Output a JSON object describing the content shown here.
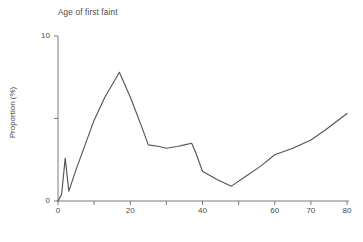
{
  "chart_data": {
    "type": "line",
    "title": "Age of first faint",
    "xlabel": "",
    "ylabel": "Proportion (%)",
    "xlim": [
      0,
      80
    ],
    "ylim": [
      0,
      10
    ],
    "grid": false,
    "legend": null,
    "x_ticks": [
      {
        "value": 0,
        "label": "0"
      },
      {
        "value": 10,
        "label": ""
      },
      {
        "value": 20,
        "label": "20"
      },
      {
        "value": 30,
        "label": ""
      },
      {
        "value": 40,
        "label": "40"
      },
      {
        "value": 50,
        "label": ""
      },
      {
        "value": 60,
        "label": "60"
      },
      {
        "value": 70,
        "label": "70"
      },
      {
        "value": 80,
        "label": "80"
      }
    ],
    "y_ticks": [
      {
        "value": 0,
        "label": "0"
      },
      {
        "value": 5,
        "label": ""
      },
      {
        "value": 10,
        "label": "10"
      }
    ],
    "line_color": "#555555",
    "series": [
      {
        "name": "Age of first faint",
        "x": [
          0,
          1,
          2,
          3,
          5,
          10,
          13,
          17,
          20,
          23,
          25,
          28,
          30,
          33,
          35,
          37,
          38,
          40,
          44,
          48,
          52,
          56,
          60,
          65,
          70,
          74,
          80
        ],
        "values": [
          0.0,
          0.4,
          2.6,
          0.6,
          1.9,
          4.9,
          6.3,
          7.8,
          6.3,
          4.6,
          3.4,
          3.3,
          3.2,
          3.3,
          3.4,
          3.5,
          3.0,
          1.8,
          1.3,
          0.9,
          1.5,
          2.1,
          2.8,
          3.2,
          3.7,
          4.3,
          5.3
        ]
      }
    ]
  },
  "axes": {
    "title_text": "Age of first faint",
    "y_label_text": "Proportion (%)"
  }
}
